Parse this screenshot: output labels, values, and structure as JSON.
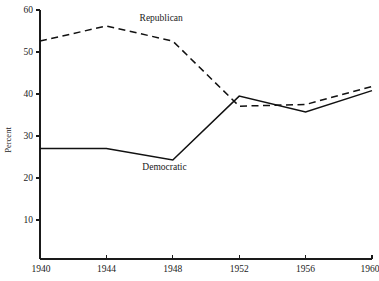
{
  "chart_data": {
    "type": "line",
    "title": "",
    "xlabel": "",
    "ylabel": "Percent",
    "x": [
      1940,
      1944,
      1948,
      1952,
      1956,
      1960
    ],
    "categories": [
      "1940",
      "1944",
      "1948",
      "1952",
      "1956",
      "1960"
    ],
    "xlim": [
      1940,
      1960
    ],
    "ylim": [
      0,
      60
    ],
    "grid": false,
    "legend_position": "inline-annotation",
    "xticks": [
      1940,
      1944,
      1948,
      1952,
      1956,
      1960
    ],
    "xtick_labels": [
      "1940",
      "1944",
      "1948",
      "1952",
      "1956",
      "1960"
    ],
    "yticks": [
      10,
      20,
      30,
      40,
      50,
      60
    ],
    "ytick_labels": [
      "10",
      "20",
      "30",
      "40",
      "50",
      "60"
    ],
    "series": [
      {
        "name": "Republican",
        "style": "dashed",
        "color": "#111111",
        "values": [
          52.6,
          56.2,
          52.6,
          37.1,
          37.5,
          41.8
        ],
        "annotation": "Republican",
        "annotation_x": 1947.3,
        "annotation_y": 57.4
      },
      {
        "name": "Democratic",
        "style": "solid",
        "color": "#111111",
        "values": [
          27.0,
          27.0,
          24.3,
          39.5,
          35.7,
          40.8
        ],
        "annotation": "Democratic",
        "annotation_x": 1947.5,
        "annotation_y": 22.0
      }
    ]
  },
  "axes": {
    "y_title": "Percent"
  }
}
